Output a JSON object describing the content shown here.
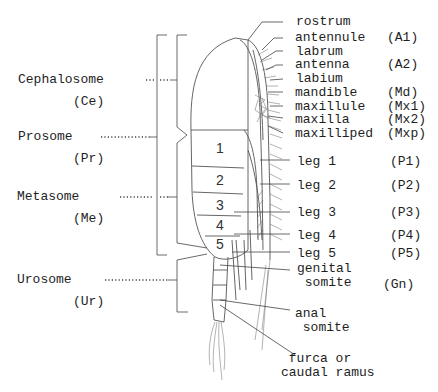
{
  "figure": {
    "tagmata": [
      {
        "name": "Cephalosome",
        "abbr": "(Ce)"
      },
      {
        "name": "Prosome",
        "abbr": "(Pr)"
      },
      {
        "name": "Metasome",
        "abbr": "(Me)"
      },
      {
        "name": "Urosome",
        "abbr": "(Ur)"
      }
    ],
    "segment_numbers": [
      "1",
      "2",
      "3",
      "4",
      "5"
    ],
    "parts": [
      {
        "name": "rostrum",
        "abbr": ""
      },
      {
        "name": "antennule",
        "abbr": "(A1)"
      },
      {
        "name": "labrum",
        "abbr": ""
      },
      {
        "name": "antenna",
        "abbr": "(A2)"
      },
      {
        "name": "labium",
        "abbr": ""
      },
      {
        "name": "mandible",
        "abbr": "(Md)"
      },
      {
        "name": "maxillule",
        "abbr": "(Mx1)"
      },
      {
        "name": "maxilla",
        "abbr": "(Mx2)"
      },
      {
        "name": "maxilliped",
        "abbr": "(Mxp)"
      },
      {
        "name": "leg 1",
        "abbr": "(P1)"
      },
      {
        "name": "leg 2",
        "abbr": "(P2)"
      },
      {
        "name": "leg 3",
        "abbr": "(P3)"
      },
      {
        "name": "leg 4",
        "abbr": "(P4)"
      },
      {
        "name": "leg 5",
        "abbr": "(P5)"
      },
      {
        "name": "genital\n somite",
        "abbr": "(Gn)"
      },
      {
        "name": "anal\n somite",
        "abbr": ""
      },
      {
        "name": " furca or\ncaudal ramus",
        "abbr": ""
      }
    ]
  }
}
